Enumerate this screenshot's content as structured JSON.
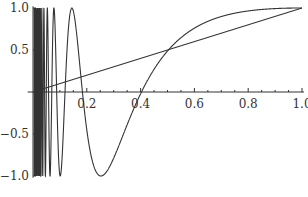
{
  "chart_data": {
    "type": "line",
    "title": "",
    "xlabel": "",
    "ylabel": "",
    "xlim": [
      0,
      1.0
    ],
    "ylim": [
      -1.0,
      1.0
    ],
    "grid": false,
    "legend": null,
    "x_ticks": [
      {
        "value": 0.2,
        "label": "0.2"
      },
      {
        "value": 0.4,
        "label": "0.4"
      },
      {
        "value": 0.6,
        "label": "0.6"
      },
      {
        "value": 0.8,
        "label": "0.8"
      },
      {
        "value": 1.0,
        "label": "1.0"
      }
    ],
    "y_ticks": [
      {
        "value": 1.0,
        "label": "1.0"
      },
      {
        "value": 0.5,
        "label": "0.5"
      },
      {
        "value": -0.5,
        "label": "−0.5"
      },
      {
        "value": -1.0,
        "label": "−1.0"
      }
    ],
    "series": [
      {
        "name": "oscillating curve",
        "description": "rapidly oscillating near x=0, approx sin(a/x + b)",
        "formula": {
          "a": 1.061,
          "b": 0.51
        },
        "key_points": [
          {
            "x": 0.163,
            "y": 1.0
          },
          {
            "x": 0.22,
            "y": 0.0
          },
          {
            "x": 0.3,
            "y": -1.0
          },
          {
            "x": 0.54,
            "y": 0.0
          },
          {
            "x": 1.0,
            "y": 1.0
          }
        ],
        "color": "#333333"
      },
      {
        "name": "line y = x",
        "x": [
          0,
          1.0
        ],
        "y": [
          0,
          1.0
        ],
        "color": "#333333"
      }
    ]
  },
  "layout": {
    "x0_px": 33,
    "px_per_x": 269,
    "y0_px": 92,
    "px_per_y": 84
  }
}
